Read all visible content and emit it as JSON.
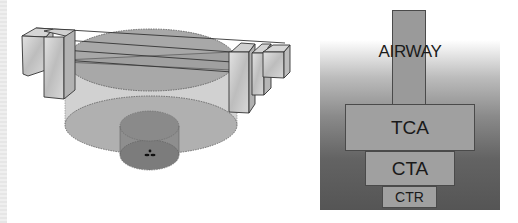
{
  "left_diagram": {
    "description": "3D perspective view of airspace volumes: large cylinder (TCA), smaller inner cylinder (CTR/CTA) with airport marker at center, and an airway corridor of rectangular prisms crossing above",
    "colors": {
      "outline": "#3a3a3a",
      "fill_light": "#c8c8c8",
      "fill_mid": "#a8a8a8",
      "fill_dark": "#7a7a7a"
    }
  },
  "right_diagram": {
    "labels": {
      "airway": "AIRWAY",
      "tca": "TCA",
      "cta": "CTA",
      "ctr": "CTR"
    },
    "colors": {
      "block_fill": "#a0a0a0",
      "block_border": "#4a4a4a",
      "background_top": "#ffffff",
      "background_bottom": "#555555",
      "text": "#1a1a1a"
    }
  }
}
